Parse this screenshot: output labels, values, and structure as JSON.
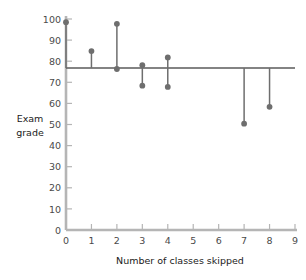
{
  "chart_data": {
    "type": "scatter",
    "title": "",
    "xlabel": "Number of classes skipped",
    "ylabel": "Exam grade",
    "xlim": [
      0,
      9
    ],
    "ylim": [
      0,
      100
    ],
    "xticks": [
      0,
      1,
      2,
      3,
      4,
      5,
      6,
      7,
      8,
      9
    ],
    "yticks": [
      0,
      10,
      20,
      30,
      40,
      50,
      60,
      70,
      80,
      90,
      100
    ],
    "grid": false,
    "legend": "none",
    "reference_line": {
      "name": "regression-line",
      "orientation": "horizontal",
      "y": 76.8,
      "x_start": 0,
      "x_end": 9
    },
    "points": [
      {
        "x": 0,
        "y": 98.5
      },
      {
        "x": 1,
        "y": 84.8
      },
      {
        "x": 2,
        "y": 97.7
      },
      {
        "x": 2,
        "y": 76.3
      },
      {
        "x": 3,
        "y": 78.1
      },
      {
        "x": 3,
        "y": 68.4
      },
      {
        "x": 4,
        "y": 81.8
      },
      {
        "x": 4,
        "y": 67.8
      },
      {
        "x": 7,
        "y": 50.4
      },
      {
        "x": 8,
        "y": 58.4
      }
    ],
    "stems": [
      {
        "x": 0,
        "from": 76.8,
        "to": 98.5
      },
      {
        "x": 1,
        "from": 76.8,
        "to": 84.8
      },
      {
        "x": 2,
        "from": 76.8,
        "to": 97.7
      },
      {
        "x": 3,
        "from": 76.8,
        "to": 78.1
      },
      {
        "x": 3,
        "from": 76.8,
        "to": 68.4
      },
      {
        "x": 4,
        "from": 76.8,
        "to": 81.8
      },
      {
        "x": 4,
        "from": 76.8,
        "to": 67.8
      },
      {
        "x": 7,
        "from": 76.8,
        "to": 50.4
      },
      {
        "x": 8,
        "from": 76.8,
        "to": 58.4
      }
    ],
    "colors": {
      "point": "#6e6e6e",
      "stem": "#6e6e6e",
      "reference_line": "#5a5a5a",
      "axis": "#b5b5b5",
      "tick_text": "#4a4a4a",
      "title_text": "#1a1a1a"
    }
  },
  "axes": {
    "y_tick_labels": [
      "100",
      "90",
      "80",
      "70",
      "60",
      "50",
      "40",
      "30",
      "20",
      "10",
      "0"
    ],
    "x_tick_labels": [
      "0",
      "1",
      "2",
      "3",
      "4",
      "5",
      "6",
      "7",
      "8",
      "9"
    ],
    "y_axis_title_line1": "Exam",
    "y_axis_title_line2": "grade",
    "x_axis_title": "Number of classes skipped"
  }
}
